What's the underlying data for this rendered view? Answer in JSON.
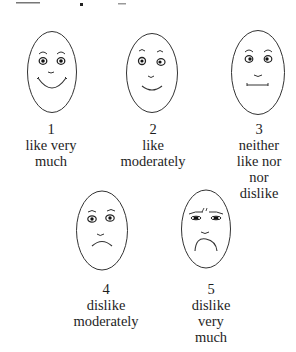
{
  "scale": [
    {
      "number": "1",
      "lines": [
        "like very",
        "much"
      ],
      "expression": "big-smile"
    },
    {
      "number": "2",
      "lines": [
        "like",
        "moderately"
      ],
      "expression": "smile"
    },
    {
      "number": "3",
      "lines": [
        "neither",
        "like nor",
        "nor",
        "dislike"
      ],
      "expression": "neutral"
    },
    {
      "number": "4",
      "lines": [
        "dislike",
        "moderately"
      ],
      "expression": "frown"
    },
    {
      "number": "5",
      "lines": [
        "dislike",
        "very",
        "much"
      ],
      "expression": "big-frown"
    }
  ],
  "colors": {
    "stroke": "#333333",
    "text": "#1e1e1e",
    "background": "#ffffff"
  }
}
